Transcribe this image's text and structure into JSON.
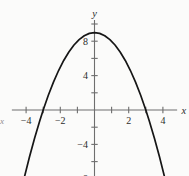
{
  "figure": {
    "background_color": "#fbfbfa",
    "axis_color": "#6e6e6e",
    "curve_color": "#161616",
    "label_color": "#2b2b2b",
    "axis_label_x": "x",
    "axis_label_y": "y",
    "edge_fragment": "x"
  },
  "chart_data": {
    "type": "line",
    "title": "",
    "xlabel": "x",
    "ylabel": "y",
    "grid": false,
    "legend": false,
    "xlim": [
      -4.8,
      4.8
    ],
    "ylim": [
      -9.2,
      10.4
    ],
    "x_tick_step": 1,
    "y_tick_step": 2,
    "x_ticks": [
      -4,
      -3,
      -2,
      -1,
      1,
      2,
      3,
      4
    ],
    "y_ticks": [
      -8,
      -6,
      -4,
      -2,
      2,
      4,
      6,
      8,
      10
    ],
    "x_tick_labels": [
      {
        "value": -4,
        "text": "−4"
      },
      {
        "value": -2,
        "text": "−2"
      },
      {
        "value": 2,
        "text": "2"
      },
      {
        "value": 4,
        "text": "4"
      }
    ],
    "y_tick_labels": [
      {
        "value": 8,
        "text": "8"
      },
      {
        "value": 4,
        "text": "4"
      },
      {
        "value": -4,
        "text": "−4"
      },
      {
        "value": -8,
        "text": "−8"
      }
    ],
    "series": [
      {
        "name": "parabola",
        "equation": "y = 9 - x^2",
        "vertex": [
          0,
          9
        ],
        "x_intercepts": [
          -3,
          3
        ],
        "y_intercept": 9,
        "opens": "down",
        "x_domain": [
          -4.1,
          4.1
        ],
        "x": [
          -4.1,
          -3.8,
          -3.5,
          -3.2,
          -3.0,
          -2.7,
          -2.4,
          -2.1,
          -1.8,
          -1.5,
          -1.2,
          -0.9,
          -0.6,
          -0.3,
          0,
          0.3,
          0.6,
          0.9,
          1.2,
          1.5,
          1.8,
          2.1,
          2.4,
          2.7,
          3.0,
          3.2,
          3.5,
          3.8,
          4.1
        ],
        "y": [
          -7.81,
          -5.44,
          -3.25,
          -1.24,
          0,
          1.71,
          3.24,
          4.59,
          5.76,
          6.75,
          7.56,
          8.19,
          8.64,
          8.91,
          9,
          8.91,
          8.64,
          8.19,
          7.56,
          6.75,
          5.76,
          4.59,
          3.24,
          1.71,
          0,
          -1.24,
          -3.25,
          -5.44,
          -7.81
        ]
      }
    ]
  }
}
